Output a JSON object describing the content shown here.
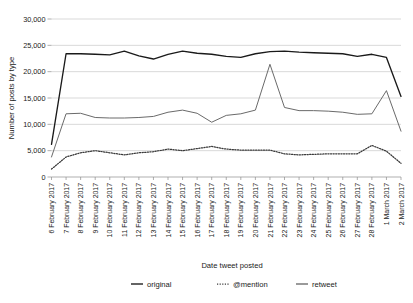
{
  "chart_data": {
    "type": "line",
    "title": "",
    "xlabel": "Date tweet posted",
    "ylabel": "Number of posts by type",
    "ylim": [
      0,
      30000
    ],
    "yticks": [
      0,
      5000,
      10000,
      15000,
      20000,
      25000,
      30000
    ],
    "ytick_labels": [
      "0",
      "5,000",
      "10,000",
      "15,000",
      "20,000",
      "25,000",
      "30,000"
    ],
    "grid": true,
    "legend_position": "bottom",
    "categories": [
      "6 February 2017",
      "7 February 2017",
      "8 February 2017",
      "9 February 2017",
      "10 February 2017",
      "11 February 2017",
      "12 February 2017",
      "13 February 2017",
      "14 February 2017",
      "15 February 2017",
      "16 February 2017",
      "17 February 2017",
      "18 February 2017",
      "19 February 2017",
      "20 February 2017",
      "21 February 2017",
      "22 February 2017",
      "23 February 2017",
      "24 February 2017",
      "25 February 2017",
      "26 February 2017",
      "27 February 2017",
      "28 February 2017",
      "1 March 2017",
      "2 March 2017"
    ],
    "series": [
      {
        "name": "original",
        "color": "#1a1a1a",
        "style": "solid",
        "values": [
          6200,
          23400,
          23400,
          23300,
          23200,
          23900,
          23000,
          22400,
          23300,
          23900,
          23500,
          23300,
          22900,
          22700,
          23400,
          23800,
          23900,
          23700,
          23600,
          23500,
          23400,
          22900,
          23300,
          22700,
          15300
        ]
      },
      {
        "name": "@mention",
        "color": "#3a3a3a",
        "style": "dotted",
        "values": [
          1500,
          3800,
          4600,
          5000,
          4600,
          4200,
          4600,
          4800,
          5300,
          5000,
          5400,
          5800,
          5300,
          5100,
          5100,
          5100,
          4400,
          4200,
          4300,
          4400,
          4400,
          4400,
          6000,
          4900,
          2600
        ]
      },
      {
        "name": "retweet",
        "color": "#6a6a6a",
        "style": "solid",
        "values": [
          3800,
          12000,
          12100,
          11300,
          11200,
          11200,
          11300,
          11500,
          12300,
          12700,
          12100,
          10400,
          11700,
          12000,
          12700,
          21400,
          13200,
          12600,
          12600,
          12500,
          12300,
          11900,
          12000,
          16400,
          8700
        ]
      }
    ]
  },
  "legend": {
    "items": [
      {
        "label": "original",
        "style": "solid",
        "color": "#1a1a1a"
      },
      {
        "label": "@mention",
        "style": "dotted",
        "color": "#3a3a3a"
      },
      {
        "label": "retweet",
        "style": "solid",
        "color": "#6a6a6a"
      }
    ]
  }
}
